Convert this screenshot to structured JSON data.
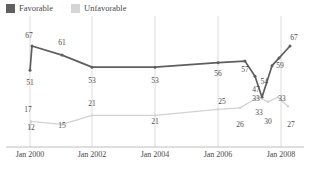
{
  "legend": {
    "position": "top-left",
    "entries": [
      {
        "label": "Favorable",
        "color": "#5f5f5f",
        "icon": "square-swatch"
      },
      {
        "label": "Unfavorable",
        "color": "#d6d6d6",
        "icon": "square-swatch"
      }
    ]
  },
  "axis": {
    "x_ticks": [
      "Jan 2000",
      "Jan 2002",
      "Jan 2004",
      "Jan 2006",
      "Jan 2008"
    ]
  },
  "chart_data": {
    "type": "line",
    "title": "",
    "subtitle": "",
    "xlabel": "",
    "ylabel": "",
    "grid": "vertical",
    "legend_position": "top-left",
    "ylim": [
      0,
      75
    ],
    "x_tick_labels": [
      "Jan 2000",
      "Jan 2002",
      "Jan 2004",
      "Jan 2006",
      "Jan 2008"
    ],
    "x_tick_positions": [
      30,
      92,
      155,
      218,
      281
    ],
    "series": [
      {
        "name": "Favorable",
        "color": "#5f5f5f",
        "values": [
          51,
          67,
          61,
          53,
          53,
          56,
          57,
          47,
          33,
          54,
          59,
          67
        ],
        "x": [
          30,
          32,
          62,
          92,
          155,
          218,
          245,
          255,
          262,
          272,
          279,
          290
        ],
        "labels": [
          "51",
          "67",
          "61",
          "53",
          "53",
          "56",
          "57",
          "47",
          "33",
          "54",
          "59",
          "67"
        ],
        "label_positions": [
          {
            "x": 30,
            "y": 85,
            "anchor": "middle"
          },
          {
            "x": 29,
            "y": 38,
            "anchor": "middle"
          },
          {
            "x": 62,
            "y": 45,
            "anchor": "middle"
          },
          {
            "x": 92,
            "y": 83,
            "anchor": "middle"
          },
          {
            "x": 155,
            "y": 83,
            "anchor": "middle"
          },
          {
            "x": 218,
            "y": 76,
            "anchor": "middle"
          },
          {
            "x": 245,
            "y": 72,
            "anchor": "middle"
          },
          {
            "x": 256,
            "y": 92,
            "anchor": "middle"
          },
          {
            "x": 259,
            "y": 115,
            "anchor": "middle"
          },
          {
            "x": 268,
            "y": 84,
            "anchor": "end"
          },
          {
            "x": 280,
            "y": 68,
            "anchor": "middle"
          },
          {
            "x": 294,
            "y": 40,
            "anchor": "middle"
          }
        ]
      },
      {
        "name": "Unfavorable",
        "color": "#d2d2d2",
        "values": [
          12,
          17,
          15,
          21,
          21,
          25,
          26,
          33,
          30,
          33,
          27
        ],
        "x": [
          30,
          31,
          62,
          92,
          155,
          218,
          240,
          258,
          268,
          278,
          288
        ],
        "labels": [
          "12",
          "17",
          "15",
          "21",
          "21",
          "25",
          "26",
          "33",
          "30",
          "33",
          "27"
        ],
        "label_positions": [
          {
            "x": 31,
            "y": 130,
            "anchor": "middle"
          },
          {
            "x": 28,
            "y": 112,
            "anchor": "middle"
          },
          {
            "x": 62,
            "y": 128,
            "anchor": "middle"
          },
          {
            "x": 92,
            "y": 106,
            "anchor": "middle"
          },
          {
            "x": 155,
            "y": 124,
            "anchor": "middle"
          },
          {
            "x": 222,
            "y": 104,
            "anchor": "middle"
          },
          {
            "x": 240,
            "y": 127,
            "anchor": "middle"
          },
          {
            "x": 256,
            "y": 101,
            "anchor": "middle"
          },
          {
            "x": 268,
            "y": 124,
            "anchor": "middle"
          },
          {
            "x": 282,
            "y": 101,
            "anchor": "middle"
          },
          {
            "x": 291,
            "y": 127,
            "anchor": "middle"
          }
        ]
      }
    ]
  }
}
